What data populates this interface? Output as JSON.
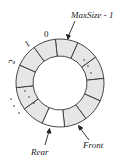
{
  "diagram": {
    "type": "circular-queue",
    "segment_count": 12,
    "colors": {
      "filled": "#e6e6e6",
      "empty": "#ffffff",
      "stroke": "#333333"
    },
    "labels": {
      "index_0": "0",
      "index_1": "1",
      "index_2": "2",
      "max": "MaxSize - 1",
      "rear": "Rear",
      "front": "Front"
    },
    "ellipsis_dots": "· · ·"
  }
}
